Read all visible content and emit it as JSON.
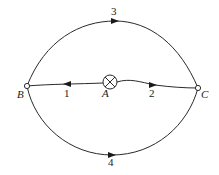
{
  "diagram": {
    "type": "network-flow",
    "nodes": [
      {
        "id": "A",
        "label": "A",
        "kind": "source",
        "symbol": "circled-x"
      },
      {
        "id": "B",
        "label": "B",
        "kind": "terminal"
      },
      {
        "id": "C",
        "label": "C",
        "kind": "terminal"
      }
    ],
    "edges": [
      {
        "id": "1",
        "label": "1",
        "from": "A",
        "to": "B",
        "shape": "straight"
      },
      {
        "id": "2",
        "label": "2",
        "from": "A",
        "to": "C",
        "shape": "wavy"
      },
      {
        "id": "3",
        "label": "3",
        "from": "B",
        "to": "C",
        "shape": "upper-arc"
      },
      {
        "id": "4",
        "label": "4",
        "from": "B",
        "to": "C",
        "shape": "lower-arc"
      }
    ]
  },
  "labels": {
    "node_a": "A",
    "node_b": "B",
    "node_c": "C",
    "edge_1": "1",
    "edge_2": "2",
    "edge_3": "3",
    "edge_4": "4"
  },
  "colors": {
    "line": "#2a2a2a",
    "background": "#ffffff"
  }
}
